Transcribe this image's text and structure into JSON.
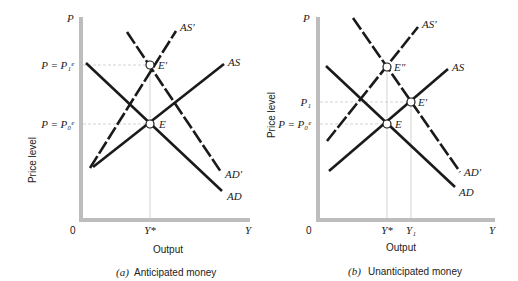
{
  "panels": [
    {
      "id": "a",
      "caption_letter": "(a)",
      "caption": "Anticipated money",
      "y_axis_symbol": "P",
      "y_axis_label": "Price level",
      "x_axis_symbol": "Y",
      "x_axis_label": "Output",
      "origin": "0",
      "x_ticks": [
        "Y*"
      ],
      "y_ticks": [
        "P = P₁ᵉ",
        "P = P₀ᵉ"
      ],
      "curves": {
        "as_prime": "AS′",
        "as": "AS",
        "ad_prime": "AD′",
        "ad": "AD"
      },
      "points": {
        "e": "E",
        "e_prime": "E′"
      }
    },
    {
      "id": "b",
      "caption_letter": "(b)",
      "caption": "Unanticipated money",
      "y_axis_symbol": "P",
      "y_axis_label": "Price level",
      "x_axis_symbol": "Y",
      "x_axis_label": "Output",
      "origin": "0",
      "x_ticks": [
        "Y*",
        "Y₁"
      ],
      "y_ticks": [
        "P₁",
        "P = P₀ᵉ"
      ],
      "curves": {
        "as_prime": "AS′",
        "as": "AS",
        "ad_prime": "AD′",
        "ad": "AD"
      },
      "points": {
        "e": "E",
        "e_prime": "E′",
        "e_double_prime": "E″"
      }
    }
  ],
  "colors": {
    "axis": "#bdbdbd",
    "curve": "#1a1a1a",
    "guide": "#c8c8c8"
  }
}
